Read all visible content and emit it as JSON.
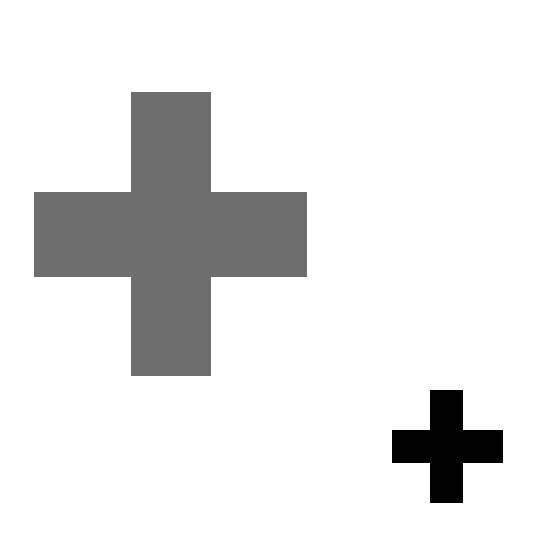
{
  "canvas": {
    "width": 559,
    "height": 554,
    "background": "#ffffff"
  },
  "shapes": [
    {
      "type": "cross",
      "name": "large-gray-cross",
      "color": "#6e6e6e",
      "vertical": {
        "x": 131,
        "y": 92,
        "w": 80,
        "h": 284
      },
      "horizontal": {
        "x": 34,
        "y": 192,
        "w": 273,
        "h": 85
      }
    },
    {
      "type": "cross",
      "name": "small-black-cross",
      "color": "#000000",
      "vertical": {
        "x": 430,
        "y": 390,
        "w": 33,
        "h": 113
      },
      "horizontal": {
        "x": 392,
        "y": 430,
        "w": 111,
        "h": 33
      }
    }
  ]
}
